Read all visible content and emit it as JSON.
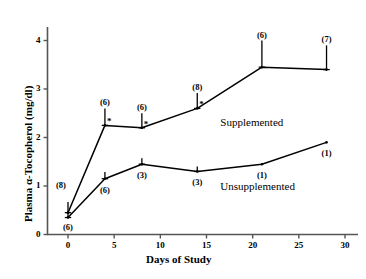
{
  "chart_data": {
    "type": "line",
    "title": "",
    "xlabel": "Days of Study",
    "ylabel": "Plasma α-Tocopherol (mg/dl)",
    "xlim": [
      -1.5,
      31
    ],
    "ylim": [
      0,
      4.35
    ],
    "xticks": [
      0,
      5,
      10,
      15,
      20,
      25,
      30
    ],
    "xtick_labels": [
      "0",
      "5",
      "10",
      "15",
      "20",
      "25",
      "30"
    ],
    "yticks": [
      0,
      1,
      2,
      3,
      4
    ],
    "ytick_labels": [
      "0",
      "1",
      "2",
      "3",
      "4"
    ],
    "grid": false,
    "legend_position": "inline-annotation",
    "x": [
      0,
      4,
      8,
      14,
      21,
      28
    ],
    "series": [
      {
        "name": "Supplemented",
        "label_text": "Supplemented",
        "label_x": 16.5,
        "label_y": 2.28,
        "values": [
          0.45,
          2.25,
          2.2,
          2.6,
          3.45,
          3.4
        ],
        "errors": [
          0.22,
          0.35,
          0.3,
          0.32,
          0.55,
          0.5
        ],
        "n": [
          "(8)",
          "(6)",
          "(6)",
          "(8)",
          "(6)",
          "(7)"
        ],
        "significance": [
          "",
          "*",
          "*",
          "*",
          "",
          ""
        ]
      },
      {
        "name": "Unsupplemented",
        "label_text": "Unsupplemented",
        "label_x": 16.5,
        "label_y": 0.95,
        "values": [
          0.35,
          1.15,
          1.45,
          1.3,
          1.45,
          1.9
        ],
        "errors": [
          0.12,
          0.14,
          0.12,
          0.1,
          0.0,
          0.0
        ],
        "n": [
          "(6)",
          "(6)",
          "(3)",
          "(3)",
          "(1)",
          "(1)"
        ],
        "significance": [
          "",
          "",
          "",
          "",
          "",
          ""
        ]
      }
    ]
  },
  "axes": {
    "x_title": "Days of Study",
    "y_title": "Plasma α-Tocopherol (mg/dl)"
  },
  "colors": {
    "line": "#000000",
    "axis": "#555555",
    "background": "#ffffff"
  }
}
